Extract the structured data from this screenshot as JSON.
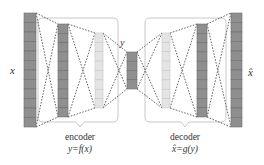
{
  "diagram": {
    "type": "autoencoder",
    "input_label": "x",
    "code_label": "y",
    "output_label": "x̂",
    "encoder": {
      "name": "encoder",
      "formula": "y=f(x)"
    },
    "decoder": {
      "name": "decoder",
      "formula": "x̂=g(y)"
    },
    "layers": [
      {
        "role": "input",
        "cells": 12,
        "shade": "dark"
      },
      {
        "role": "encoder-hidden-1",
        "cells": 10,
        "shade": "dark"
      },
      {
        "role": "encoder-hidden-2",
        "cells": 8,
        "shade": "light"
      },
      {
        "role": "code",
        "cells": 4,
        "shade": "dark"
      },
      {
        "role": "decoder-hidden-1",
        "cells": 8,
        "shade": "light"
      },
      {
        "role": "decoder-hidden-2",
        "cells": 10,
        "shade": "dark"
      },
      {
        "role": "output",
        "cells": 12,
        "shade": "dark"
      }
    ],
    "colors": {
      "dark_fill": "#8f8f8f",
      "light_fill": "#e4e4e4",
      "line": "#555555",
      "bracket": "#c8c8c8"
    }
  }
}
